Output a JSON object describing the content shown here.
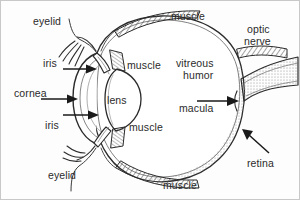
{
  "diagram": {
    "background_color": "#fdfdfd",
    "ink_color": "#2b2b2b",
    "shade_color": "#9a9a9a",
    "labels": [
      {
        "id": "eyelid-top",
        "text": "eyelid",
        "x": 32,
        "y": 15
      },
      {
        "id": "muscle-top",
        "text": "muscle",
        "x": 170,
        "y": 10
      },
      {
        "id": "optic",
        "text": "optic",
        "x": 246,
        "y": 23
      },
      {
        "id": "nerve",
        "text": "nerve",
        "x": 243,
        "y": 35
      },
      {
        "id": "iris-top",
        "text": "iris",
        "x": 42,
        "y": 57
      },
      {
        "id": "muscle-upper",
        "text": "muscle",
        "x": 126,
        "y": 59
      },
      {
        "id": "vitreous",
        "text": "vitreous",
        "x": 175,
        "y": 57
      },
      {
        "id": "humor",
        "text": "humor",
        "x": 182,
        "y": 69
      },
      {
        "id": "cornea",
        "text": "cornea",
        "x": 13,
        "y": 87
      },
      {
        "id": "lens",
        "text": "lens",
        "x": 106,
        "y": 94
      },
      {
        "id": "macula",
        "text": "macula",
        "x": 178,
        "y": 102
      },
      {
        "id": "iris-bottom",
        "text": "iris",
        "x": 44,
        "y": 119
      },
      {
        "id": "muscle-lower",
        "text": "muscle",
        "x": 128,
        "y": 121
      },
      {
        "id": "retina",
        "text": "retina",
        "x": 246,
        "y": 157
      },
      {
        "id": "eyelid-bottom",
        "text": "eyelid",
        "x": 47,
        "y": 169
      },
      {
        "id": "muscle-bottom",
        "text": "muscle",
        "x": 162,
        "y": 179
      }
    ],
    "arrows": [
      {
        "id": "arrow-iris-top",
        "from": [
          62,
          68
        ],
        "to": [
          95,
          68
        ]
      },
      {
        "id": "arrow-cornea",
        "from": [
          40,
          98
        ],
        "to": [
          78,
          98
        ]
      },
      {
        "id": "arrow-iris-bottom",
        "from": [
          62,
          114
        ],
        "to": [
          97,
          114
        ]
      },
      {
        "id": "arrow-macula",
        "from": [
          196,
          100
        ],
        "to": [
          237,
          100
        ]
      },
      {
        "id": "arrow-retina",
        "from": [
          268,
          152
        ],
        "to": [
          242,
          130
        ]
      }
    ],
    "parts": [
      "eyelid",
      "iris",
      "cornea",
      "lens",
      "muscle",
      "vitreous humor",
      "macula",
      "retina",
      "optic nerve"
    ]
  }
}
